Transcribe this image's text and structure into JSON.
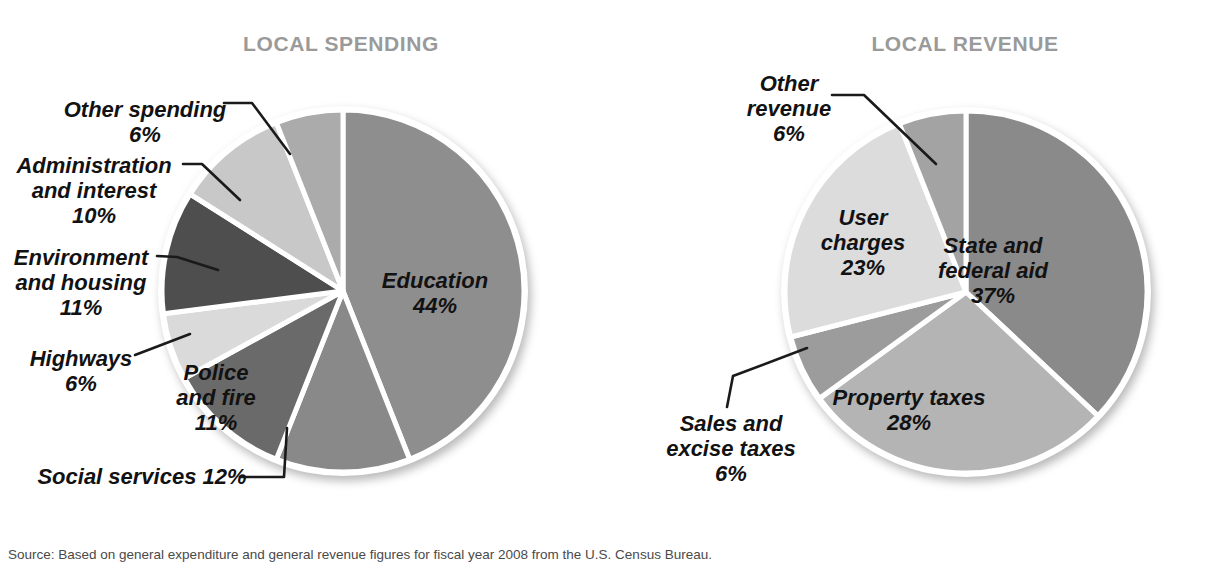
{
  "chart_data": [
    {
      "id": "local-spending",
      "type": "pie",
      "title": "LOCAL SPENDING",
      "start_angle_deg": 0,
      "direction": "clockwise",
      "units": "percent of total local spending",
      "slices": [
        {
          "label": "Education",
          "pct": 44,
          "color": "#8e8e8e",
          "label_lines": [
            "Education",
            "44%"
          ],
          "label_placement": "inside"
        },
        {
          "label": "Social services",
          "pct": 12,
          "color": "#898989",
          "label_lines": [
            "Social services 12%"
          ],
          "label_placement": "outside"
        },
        {
          "label": "Police and fire",
          "pct": 11,
          "color": "#6a6a6a",
          "label_lines": [
            "Police",
            "and fire",
            "11%"
          ],
          "label_placement": "inside"
        },
        {
          "label": "Highways",
          "pct": 6,
          "color": "#dadada",
          "label_lines": [
            "Highways",
            "6%"
          ],
          "label_placement": "outside"
        },
        {
          "label": "Environment and housing",
          "pct": 11,
          "color": "#4e4e4e",
          "label_lines": [
            "Environment",
            "and housing",
            "11%"
          ],
          "label_placement": "outside"
        },
        {
          "label": "Administration and interest",
          "pct": 10,
          "color": "#c8c8c8",
          "label_lines": [
            "Administration",
            "and interest",
            "10%"
          ],
          "label_placement": "outside"
        },
        {
          "label": "Other spending",
          "pct": 6,
          "color": "#ababab",
          "label_lines": [
            "Other spending",
            "6%"
          ],
          "label_placement": "outside"
        }
      ]
    },
    {
      "id": "local-revenue",
      "type": "pie",
      "title": "LOCAL REVENUE",
      "start_angle_deg": 0,
      "direction": "clockwise",
      "units": "percent of total local revenue",
      "slices": [
        {
          "label": "State and federal aid",
          "pct": 37,
          "color": "#8a8a8a",
          "label_lines": [
            "State and",
            "federal aid",
            "37%"
          ],
          "label_placement": "inside"
        },
        {
          "label": "Property taxes",
          "pct": 28,
          "color": "#b4b4b4",
          "label_lines": [
            "Property taxes",
            "28%"
          ],
          "label_placement": "inside"
        },
        {
          "label": "Sales and excise taxes",
          "pct": 6,
          "color": "#9c9c9c",
          "label_lines": [
            "Sales and",
            "excise taxes",
            "6%"
          ],
          "label_placement": "outside"
        },
        {
          "label": "User charges",
          "pct": 23,
          "color": "#dcdcdc",
          "label_lines": [
            "User",
            "charges",
            "23%"
          ],
          "label_placement": "inside"
        },
        {
          "label": "Other revenue",
          "pct": 6,
          "color": "#a3a3a3",
          "label_lines": [
            "Other",
            "revenue",
            "6%"
          ],
          "label_placement": "outside"
        }
      ]
    }
  ],
  "source_note": "Source: Based on general expenditure and general revenue figures for fiscal year 2008 from the U.S. Census Bureau.",
  "colors": {
    "background": "#ffffff",
    "title_text": "#9a9a9a",
    "label_text": "#121212",
    "callout_line": "#1a1a1a",
    "pie_rim": "#ffffff"
  }
}
